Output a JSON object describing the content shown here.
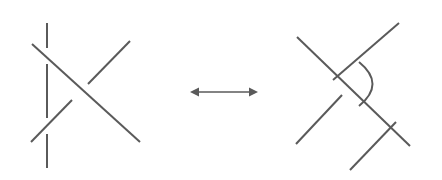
{
  "figure": {
    "width": 442,
    "height": 180,
    "background_color": "#ffffff",
    "stroke_color": "#5a5a5a",
    "stroke_width": 2
  },
  "arrow": {
    "name": "double-headed-arrow",
    "direction": "both",
    "x_start": 190,
    "x_end": 258,
    "y": 92,
    "head_length": 9,
    "head_half_width": 4.5,
    "color": "#5a5a5a"
  },
  "left_diagram": {
    "label": "left-tangle",
    "strands": [
      {
        "name": "vertical-strand-top-segment",
        "type": "line",
        "x1": 47,
        "y1": 23,
        "x2": 47,
        "y2": 48,
        "role": "under"
      },
      {
        "name": "vertical-strand-middle-segment",
        "type": "line",
        "x1": 47,
        "y1": 64,
        "x2": 47,
        "y2": 118,
        "role": "under"
      },
      {
        "name": "vertical-strand-bottom-segment",
        "type": "line",
        "x1": 47,
        "y1": 134,
        "x2": 47,
        "y2": 168,
        "role": "under"
      },
      {
        "name": "descending-diagonal-strand",
        "type": "line",
        "x1": 32,
        "y1": 44,
        "x2": 140,
        "y2": 142,
        "role": "over"
      },
      {
        "name": "ascending-diagonal-upper-segment",
        "type": "line",
        "x1": 88,
        "y1": 84,
        "x2": 130,
        "y2": 41,
        "role": "under"
      },
      {
        "name": "ascending-diagonal-lower-segment",
        "type": "line",
        "x1": 31,
        "y1": 142,
        "x2": 72,
        "y2": 100,
        "role": "under"
      }
    ]
  },
  "right_diagram": {
    "label": "right-tangle",
    "strands": [
      {
        "name": "descending-diagonal-strand",
        "type": "line",
        "x1": 297,
        "y1": 37,
        "x2": 410,
        "y2": 146,
        "role": "over"
      },
      {
        "name": "upper-ascending-strand",
        "type": "line",
        "x1": 333,
        "y1": 80,
        "x2": 399,
        "y2": 23,
        "role": "under"
      },
      {
        "name": "lower-ascending-strand-left",
        "type": "line",
        "x1": 296,
        "y1": 144,
        "x2": 342,
        "y2": 95,
        "role": "under"
      },
      {
        "name": "lower-ascending-strand-right",
        "type": "line",
        "x1": 350,
        "y1": 170,
        "x2": 396,
        "y2": 122,
        "role": "under"
      },
      {
        "name": "curved-arc-strand",
        "type": "arc",
        "x1": 359,
        "y1": 62,
        "x2": 359,
        "y2": 106,
        "bulge_x": 386,
        "role": "under"
      }
    ]
  }
}
